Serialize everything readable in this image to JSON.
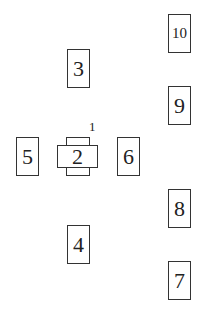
{
  "diagram": {
    "center_component": {
      "label": "2",
      "annotation": "1"
    },
    "boxes": [
      {
        "id": "3",
        "label": "3"
      },
      {
        "id": "4",
        "label": "4"
      },
      {
        "id": "5",
        "label": "5"
      },
      {
        "id": "6",
        "label": "6"
      },
      {
        "id": "7",
        "label": "7"
      },
      {
        "id": "8",
        "label": "8"
      },
      {
        "id": "9",
        "label": "9"
      },
      {
        "id": "10",
        "label": "10"
      }
    ]
  }
}
